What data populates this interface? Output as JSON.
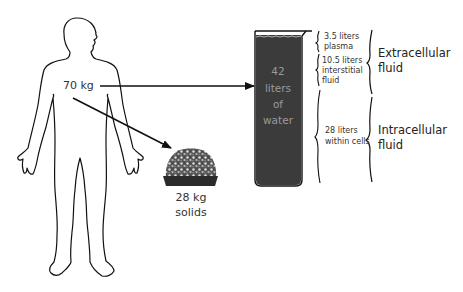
{
  "figure": {
    "body_weight_label": "70 kg",
    "solids": {
      "weight_label": "28 kg",
      "name_label": "solids"
    },
    "beaker": {
      "lines": [
        "42",
        "liters",
        "of",
        "water"
      ],
      "fill_color": "#3b3b3b",
      "text_color": "#9a9a9a"
    },
    "compartments": [
      {
        "volume": "3.5 liters",
        "name_lines": [
          "plasma"
        ]
      },
      {
        "volume": "10.5 liters",
        "name_lines": [
          "interstitial",
          "fluid"
        ]
      },
      {
        "volume": "28 liters",
        "name_lines": [
          "within cells"
        ]
      }
    ],
    "groups": [
      {
        "lines": [
          "Extracellular",
          "fluid"
        ]
      },
      {
        "lines": [
          "Intracellular",
          "fluid"
        ]
      }
    ]
  }
}
